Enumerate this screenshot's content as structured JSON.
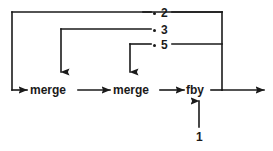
{
  "diagram": {
    "type": "dataflow-graph",
    "stroke_color": "#1a1a1a",
    "background_color": "#ffffff",
    "nodes": [
      {
        "id": "merge1",
        "label": "merge"
      },
      {
        "id": "merge2",
        "label": "merge"
      },
      {
        "id": "fby",
        "label": "fby"
      }
    ],
    "constants": [
      {
        "id": "const2",
        "label": "2",
        "bullet": "•"
      },
      {
        "id": "const3",
        "label": "3",
        "bullet": "•"
      },
      {
        "id": "const5",
        "label": "5",
        "bullet": "•"
      },
      {
        "id": "const1",
        "label": "1",
        "bullet": ""
      }
    ],
    "edges": [
      {
        "from": "feedback-bus",
        "to": "merge1",
        "style": "solid",
        "arrow": "right"
      },
      {
        "from": "const3",
        "to": "merge1",
        "style": "solid",
        "arrow": "down"
      },
      {
        "from": "merge1",
        "to": "merge2",
        "style": "solid",
        "arrow": "right"
      },
      {
        "from": "const5",
        "to": "merge2",
        "style": "solid",
        "arrow": "down"
      },
      {
        "from": "merge2",
        "to": "fby",
        "style": "solid",
        "arrow": "right"
      },
      {
        "from": "const1",
        "to": "fby",
        "style": "solid",
        "arrow": "up"
      },
      {
        "from": "fby",
        "to": "output",
        "style": "solid",
        "arrow": "right"
      },
      {
        "from": "fby",
        "to": "const2-bus",
        "style": "solid",
        "arrow": "none"
      }
    ]
  }
}
